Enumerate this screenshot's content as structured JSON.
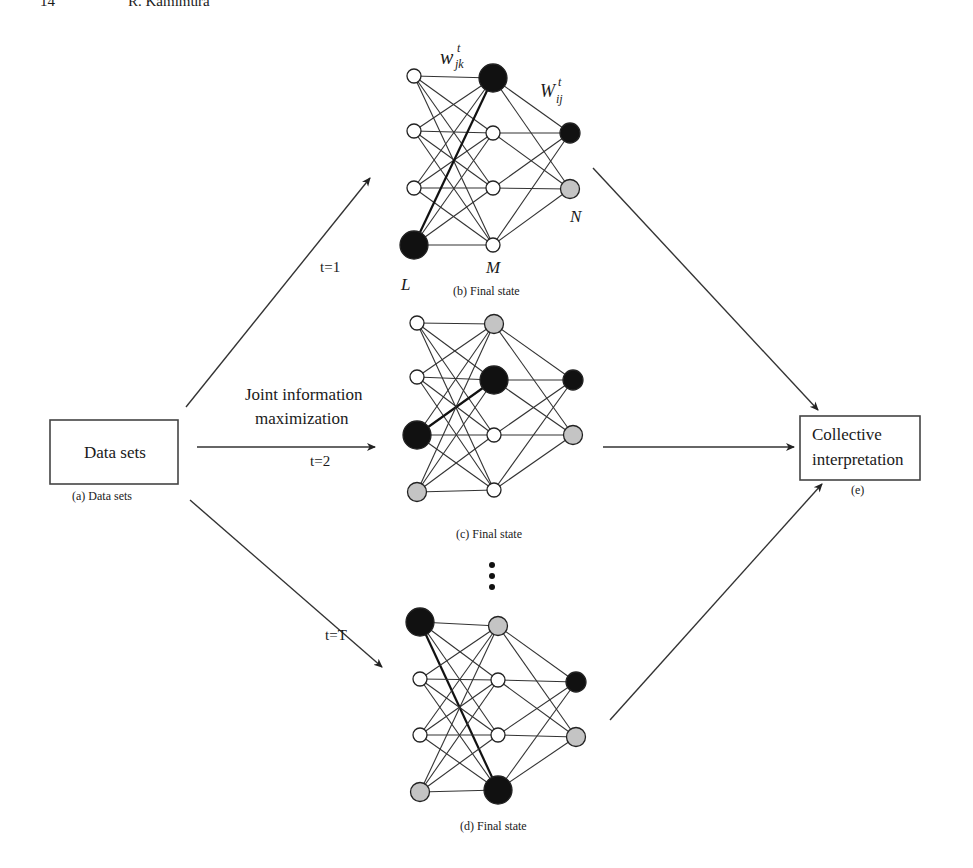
{
  "header": {
    "page_number": "14",
    "author": "R. Kamimura"
  },
  "inputs_box": {
    "label": "Data sets",
    "caption": "(a) Data sets"
  },
  "output_box": {
    "line1": "Collective",
    "line2": "interpretation",
    "caption": "(e)"
  },
  "process_label": {
    "line1": "Joint information",
    "line2": "maximization"
  },
  "arrows": [
    {
      "id": "t1",
      "label": "t=1"
    },
    {
      "id": "t2",
      "label": "t=2"
    },
    {
      "id": "tT",
      "label": "t=T"
    }
  ],
  "ellipsis": "⋮",
  "colors": {
    "black": "#111111",
    "gray": "#c4c4c4",
    "white": "#ffffff"
  },
  "networks": [
    {
      "id": "b",
      "caption": "(b) Final state",
      "labels": {
        "input_layer": "L",
        "hidden_layer": "M",
        "output_layer": "N",
        "w_jk": "w",
        "w_jk_sub": "jk",
        "w_jk_sup": "t",
        "w_ij": "W",
        "w_ij_sub": "ij",
        "w_ij_sup": "t"
      },
      "input_states": [
        "white",
        "white",
        "white",
        "black-large"
      ],
      "hidden_states": [
        "black-large",
        "white",
        "white",
        "white"
      ],
      "output_states": [
        "black",
        "gray"
      ],
      "strong_edge": {
        "from_input": 3,
        "to_hidden": 0
      }
    },
    {
      "id": "c",
      "caption": "(c) Final state",
      "input_states": [
        "white",
        "white",
        "black-large",
        "gray"
      ],
      "hidden_states": [
        "gray",
        "black-large",
        "white",
        "white"
      ],
      "output_states": [
        "black",
        "gray"
      ],
      "strong_edge": {
        "from_input": 2,
        "to_hidden": 1
      }
    },
    {
      "id": "d",
      "caption": "(d) Final state",
      "input_states": [
        "black-large",
        "white",
        "white",
        "gray"
      ],
      "hidden_states": [
        "gray",
        "white",
        "white",
        "black-large"
      ],
      "output_states": [
        "black",
        "gray"
      ],
      "strong_edge": {
        "from_input": 0,
        "to_hidden": 3
      }
    }
  ]
}
